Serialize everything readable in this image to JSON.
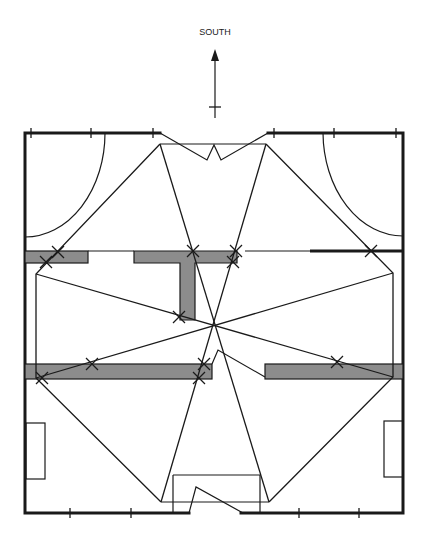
{
  "diagram": {
    "type": "floor-plan-sightline-diagram",
    "orientation_label": "SOUTH",
    "orientation_arrow": "up",
    "colors": {
      "line": "#1a1a1a",
      "partition_fill": "#8c8c8c",
      "background": "#ffffff"
    },
    "room": {
      "outer_bounds": {
        "left": 25,
        "top": 133,
        "right": 403,
        "bottom": 513
      },
      "top_openings": [
        {
          "x1": 160,
          "x2": 268
        }
      ],
      "bottom_opening": {
        "x1": 189,
        "x2": 241
      }
    },
    "partitions": [
      {
        "id": "upper-left",
        "x": 25,
        "y": 251,
        "w": 63,
        "h": 12
      },
      {
        "id": "upper-center-t-bar",
        "x": 134,
        "y": 251,
        "w": 103,
        "h": 12
      },
      {
        "id": "upper-center-t-stem",
        "x": 180,
        "y": 263,
        "w": 15,
        "h": 57
      },
      {
        "id": "lower-left",
        "x": 25,
        "y": 364,
        "w": 187,
        "h": 15
      },
      {
        "id": "lower-right",
        "x": 265,
        "y": 364,
        "w": 138,
        "h": 15
      }
    ],
    "sightline_center": {
      "x": 215,
      "y": 326
    },
    "sightline_nodes": [
      {
        "x": 160,
        "y": 144
      },
      {
        "x": 266,
        "y": 144
      },
      {
        "x": 36,
        "y": 274
      },
      {
        "x": 393,
        "y": 273
      },
      {
        "x": 36,
        "y": 378
      },
      {
        "x": 393,
        "y": 377
      },
      {
        "x": 161,
        "y": 502
      },
      {
        "x": 269,
        "y": 502
      }
    ],
    "crossing_marks": [
      {
        "x": 58,
        "y": 252
      },
      {
        "x": 46,
        "y": 262
      },
      {
        "x": 193,
        "y": 251
      },
      {
        "x": 236,
        "y": 251
      },
      {
        "x": 233,
        "y": 262
      },
      {
        "x": 371,
        "y": 251
      },
      {
        "x": 179,
        "y": 317
      },
      {
        "x": 92,
        "y": 364
      },
      {
        "x": 42,
        "y": 378
      },
      {
        "x": 204,
        "y": 364
      },
      {
        "x": 199,
        "y": 378
      },
      {
        "x": 337,
        "y": 362
      }
    ],
    "fixtures": [
      {
        "id": "left-cabinet",
        "x": 26,
        "y": 423,
        "w": 19,
        "h": 56
      },
      {
        "id": "right-cabinet",
        "x": 384,
        "y": 421,
        "w": 19,
        "h": 56
      },
      {
        "id": "entry-vestibule",
        "x": 173,
        "y": 475,
        "w": 87,
        "h": 38
      }
    ],
    "door_swings": [
      {
        "id": "upper-left-swing",
        "corner": "top-left"
      },
      {
        "id": "upper-right-swing",
        "corner": "top-right"
      }
    ]
  }
}
